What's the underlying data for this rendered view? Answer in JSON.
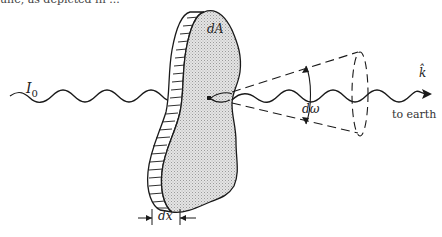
{
  "diagram": {
    "type": "radiation-transfer-slab",
    "caption_fragment": "une, as depicted in ...",
    "labels": {
      "incident_intensity": "I",
      "incident_intensity_sub": "0",
      "area_element": "dA",
      "solid_angle": "dω",
      "direction_vector": "k̂",
      "destination": "to earth",
      "thickness": "dx"
    },
    "elements": [
      {
        "id": "incident-wave",
        "kind": "wavy-arrow",
        "label": "I0"
      },
      {
        "id": "slab",
        "kind": "irregular-slab",
        "label": "dA",
        "thickness_label": "dx"
      },
      {
        "id": "emission-point",
        "kind": "point"
      },
      {
        "id": "solid-angle-cone",
        "kind": "dashed-cone",
        "label": "dω"
      },
      {
        "id": "outgoing-wave",
        "kind": "wavy-arrow",
        "label": "k̂",
        "note": "to earth"
      }
    ],
    "colors": {
      "stroke": "#1a1a1a",
      "slab_fill": "#d0d0d0",
      "background": "#ffffff"
    }
  }
}
